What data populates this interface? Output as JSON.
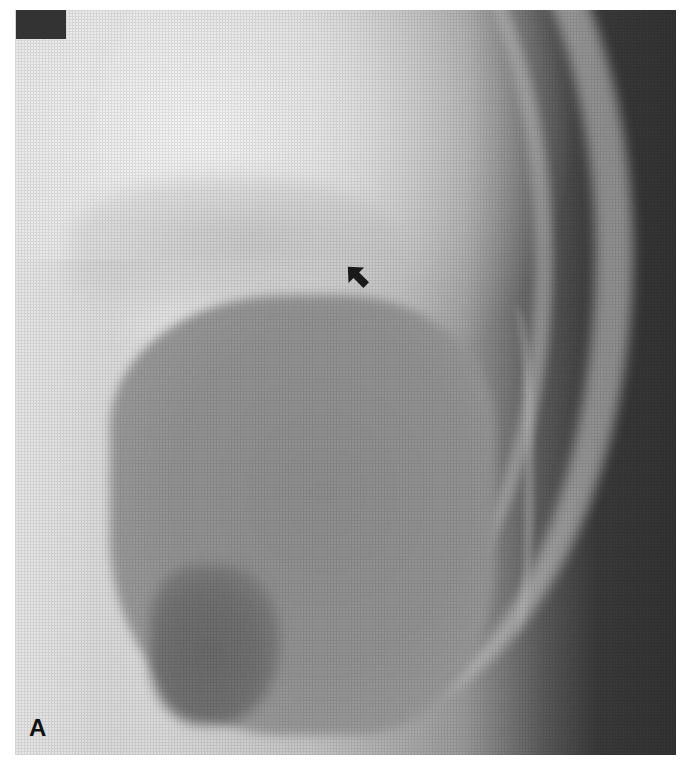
{
  "figure": {
    "type": "radiograph",
    "panel_label": "A",
    "annotation": {
      "kind": "arrow",
      "direction": "up-right",
      "color": "#1a1a1a"
    },
    "label_box_color": "#333333",
    "background_dark_color": "#333333",
    "background_light_color": "#e8e8e8"
  }
}
